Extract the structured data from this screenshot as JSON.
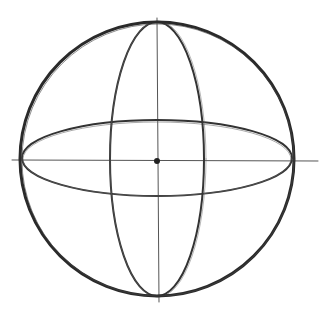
{
  "drawing": {
    "subject": "sphere construction sketch",
    "stroke_color": "#2a2a2a",
    "guide_color": "#555555",
    "background": "#ffffff",
    "outer_circle": {
      "cx": 157,
      "cy": 159,
      "r": 137
    },
    "vertical_ellipse": {
      "cx": 157,
      "cy": 159,
      "rx": 47,
      "ry": 137
    },
    "horizontal_ellipse": {
      "cx": 157,
      "cy": 158,
      "rx": 135,
      "ry": 38
    },
    "horizontal_axis": {
      "x1": 12,
      "y1": 160,
      "x2": 318,
      "y2": 161
    },
    "vertical_axis": {
      "x1": 157,
      "y1": 18,
      "x2": 159,
      "y2": 302
    },
    "center_point": {
      "cx": 157,
      "cy": 161,
      "r": 3
    }
  }
}
